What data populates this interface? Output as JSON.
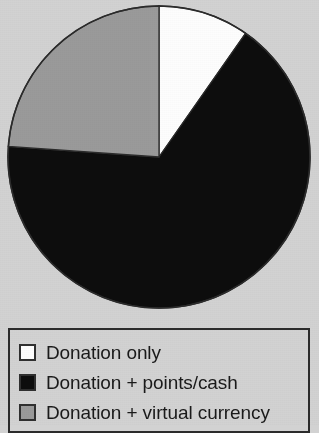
{
  "figure": {
    "background_color": "#d2d2d2",
    "outline_color": "#2b2b2b"
  },
  "chart_data": {
    "type": "pie",
    "title": "",
    "subtitle": "",
    "xlabel": "",
    "ylabel": "",
    "grid": false,
    "legend_position": "bottom",
    "start_angle_deg": 0,
    "direction": "clockwise",
    "center": {
      "x": 159,
      "y": 157
    },
    "radius": 151,
    "categories": [
      "Donation only",
      "Donation + points/cash",
      "Donation + virtual currency"
    ],
    "values": [
      9.7,
      66.4,
      23.9
    ],
    "angles_deg": [
      35,
      239,
      86
    ],
    "colors": [
      "#fdfdfd",
      "#0d0d0d",
      "#9a9a9a"
    ],
    "slices": [
      {
        "label": "Donation only",
        "value": 9.7,
        "angle_deg": 35,
        "start_deg": 0,
        "end_deg": 35,
        "color": "#fdfdfd",
        "swatch_border": "#2f2f2f"
      },
      {
        "label": "Donation + points/cash",
        "value": 66.4,
        "angle_deg": 239,
        "start_deg": 35,
        "end_deg": 274,
        "color": "#0d0d0d",
        "swatch_border": "#2f2f2f"
      },
      {
        "label": "Donation + virtual currency",
        "value": 23.9,
        "angle_deg": 86,
        "start_deg": 274,
        "end_deg": 360,
        "color": "#9a9a9a",
        "swatch_border": "#2f2f2f"
      }
    ]
  },
  "legend": {
    "items": [
      {
        "label": "Donation only",
        "color": "#fdfdfd"
      },
      {
        "label": "Donation + points/cash",
        "color": "#0d0d0d"
      },
      {
        "label": "Donation + virtual currency",
        "color": "#9a9a9a"
      }
    ]
  }
}
